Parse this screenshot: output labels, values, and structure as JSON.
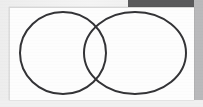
{
  "document": {
    "type": "scanned-page",
    "paper_color": "#fdfdfd",
    "backdrop_color": "#ededed",
    "dark_band_color": "#5a5a5c",
    "right_margin_color": "#b9b9bb",
    "caption": ""
  },
  "diagram": {
    "kind": "venn-diagram",
    "shape_count": 2,
    "stroke_color": "#333336",
    "stroke_width": 2,
    "fill": "none",
    "circles": [
      {
        "label": "",
        "cx": 63,
        "cy": 53,
        "rx": 43,
        "ry": 41
      },
      {
        "label": "",
        "cx": 135,
        "cy": 53,
        "rx": 51,
        "ry": 41
      }
    ],
    "intersection_points": [
      {
        "x": 97,
        "y": 22
      },
      {
        "x": 97,
        "y": 85
      }
    ],
    "labels": []
  },
  "chart_data": {
    "type": "diagram",
    "title": "",
    "xlabel": "",
    "ylabel": "",
    "categories": [
      "left-set",
      "right-set"
    ],
    "values": [
      1,
      1
    ],
    "annotations": []
  }
}
